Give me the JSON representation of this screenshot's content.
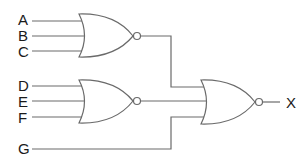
{
  "diagram": {
    "type": "logic-circuit",
    "inputs": [
      "A",
      "B",
      "C",
      "D",
      "E",
      "F",
      "G"
    ],
    "output": "X",
    "gates": [
      {
        "id": "nor1",
        "type": "NOR",
        "inputs": [
          "A",
          "B",
          "C"
        ]
      },
      {
        "id": "nor2",
        "type": "NOR",
        "inputs": [
          "D",
          "E",
          "F"
        ]
      },
      {
        "id": "nor3",
        "type": "NOR",
        "inputs": [
          "nor1",
          "nor2",
          "G"
        ],
        "output": "X"
      }
    ],
    "colors": {
      "line": "#6a6a6a",
      "text": "#1a1a1a",
      "background": "#ffffff"
    }
  }
}
